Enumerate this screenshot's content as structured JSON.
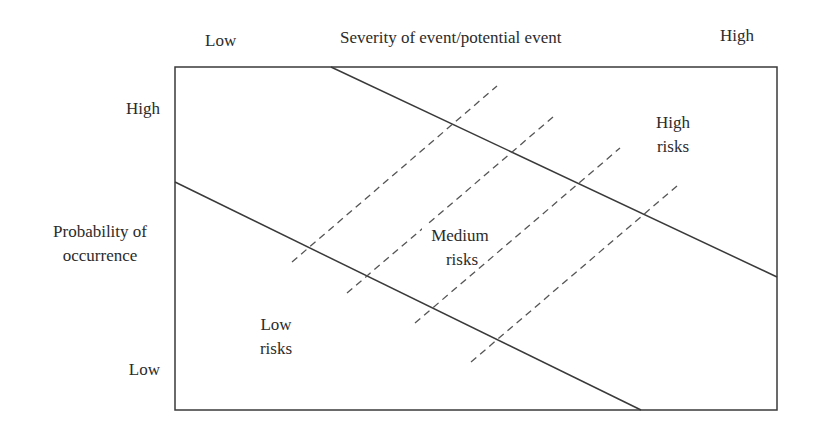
{
  "diagram": {
    "type": "risk-matrix",
    "x_axis": {
      "title": "Severity of event/potential event",
      "low_label": "Low",
      "high_label": "High"
    },
    "y_axis": {
      "title_line1": "Probability of",
      "title_line2": "occurrence",
      "high_label": "High",
      "low_label": "Low"
    },
    "regions": {
      "low": {
        "line1": "Low",
        "line2": "risks"
      },
      "medium": {
        "line1": "Medium",
        "line2": "risks"
      },
      "high": {
        "line1": "High",
        "line2": "risks"
      }
    },
    "colors": {
      "line": "#3a3a3a",
      "dashed": "#555555",
      "background": "#ffffff"
    }
  }
}
